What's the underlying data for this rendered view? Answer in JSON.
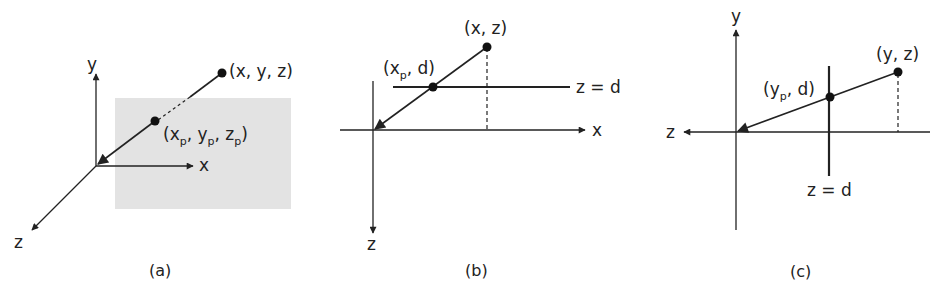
{
  "figure": {
    "panels": [
      {
        "id": "a",
        "caption": "(a)",
        "axes": {
          "y": "y",
          "x": "x",
          "z": "z"
        },
        "point": "(x, y, z)",
        "projected_point": {
          "open": "(x",
          "sub1": "p",
          "mid1": ", y",
          "sub2": "p",
          "mid2": ", z",
          "sub3": "p",
          "close": ")"
        },
        "plane_color": "#e3e3e3"
      },
      {
        "id": "b",
        "caption": "(b)",
        "axes": {
          "x": "x",
          "z": "z"
        },
        "point": "(x, z)",
        "projected_point": {
          "open": "(x",
          "sub1": "p",
          "rest": ", d)"
        },
        "plane_label": "z = d"
      },
      {
        "id": "c",
        "caption": "(c)",
        "axes": {
          "y": "y",
          "z": "z"
        },
        "point": "(y, z)",
        "projected_point": {
          "open": "(y",
          "sub1": "p",
          "rest": ", d)"
        },
        "plane_label": "z = d"
      }
    ],
    "colors": {
      "ink": "#222222",
      "plane": "#e3e3e3",
      "background": "#ffffff"
    }
  }
}
